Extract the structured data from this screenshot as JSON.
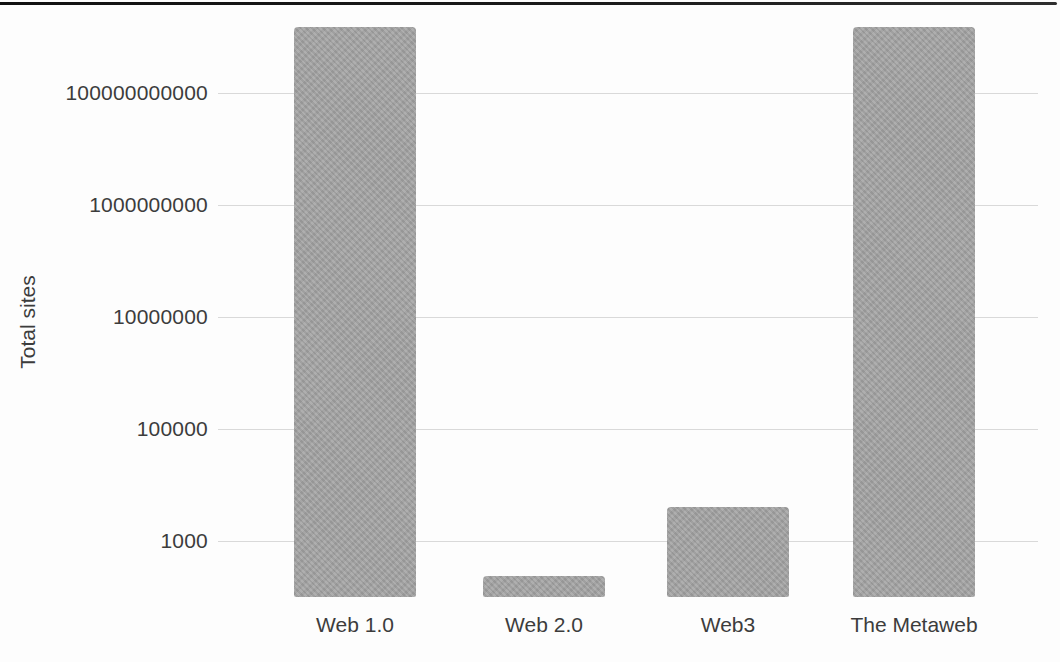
{
  "page": {
    "background": "#fdfdfd",
    "top_rule_color": "#1a1a1a"
  },
  "chart_data": {
    "type": "bar",
    "title": "",
    "xlabel": "",
    "ylabel": "Total sites",
    "y_scale": "log",
    "categories": [
      "Web 1.0",
      "Web 2.0",
      "Web3",
      "The Metaweb"
    ],
    "values": [
      1500000000000,
      240,
      4000,
      1500000000000
    ],
    "yticks": [
      {
        "label": "1000",
        "value": 1000
      },
      {
        "label": "100000",
        "value": 100000
      },
      {
        "label": "10000000",
        "value": 10000000
      },
      {
        "label": "1000000000",
        "value": 1000000000
      },
      {
        "label": "100000000000",
        "value": 100000000000
      }
    ],
    "ylim": [
      100,
      2000000000000
    ],
    "grid": true,
    "legend": false,
    "bar_color": "#a4a4a4",
    "gridline_color": "#d9d9d9",
    "text_color": "#3c3c3c"
  }
}
